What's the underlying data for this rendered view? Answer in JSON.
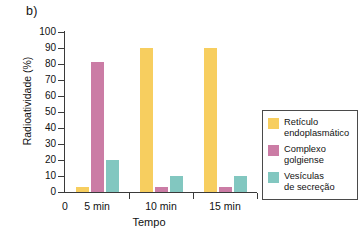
{
  "panel": {
    "label": "b)"
  },
  "chart_data": {
    "type": "bar",
    "title": "",
    "xlabel": "Tempo",
    "ylabel": "Radioatividade (%)",
    "categories": [
      "5 min",
      "10 min",
      "15 min"
    ],
    "xtick_labels": [
      "0",
      "5 min",
      "10 min",
      "15 min"
    ],
    "ylim": [
      0,
      100
    ],
    "yticks": [
      0,
      10,
      20,
      30,
      40,
      50,
      60,
      70,
      80,
      90,
      100
    ],
    "ytick_labels": [
      "0",
      "10",
      "20",
      "30",
      "40",
      "50",
      "60",
      "70",
      "80",
      "90",
      "100"
    ],
    "grid": false,
    "legend_position": "right",
    "series": [
      {
        "name": "Retículo endoplasmático",
        "color": "#f7ce5f",
        "values": [
          3,
          90,
          90
        ]
      },
      {
        "name": "Complexo golgiense",
        "color": "#cb7ca5",
        "values": [
          81,
          3,
          3
        ]
      },
      {
        "name": "Vesículas de secreção",
        "color": "#82c7c0",
        "values": [
          20,
          10,
          10
        ]
      }
    ]
  },
  "legend": {
    "entries": [
      {
        "label_line1": "Retículo",
        "label_line2": "endoplasmático",
        "color": "#f7ce5f"
      },
      {
        "label_line1": "Complexo",
        "label_line2": "golgiense",
        "color": "#cb7ca5"
      },
      {
        "label_line1": "Vesículas",
        "label_line2": "de secreção",
        "color": "#82c7c0"
      }
    ]
  }
}
